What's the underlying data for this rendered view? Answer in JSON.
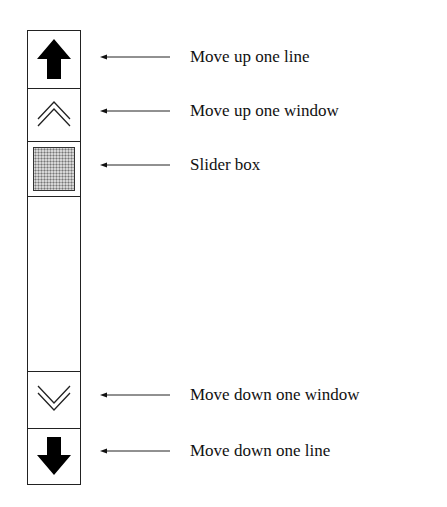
{
  "diagram": {
    "scrollbar": {
      "segments": [
        {
          "id": "line-up",
          "icon": "solid-up-arrow-icon"
        },
        {
          "id": "window-up",
          "icon": "double-chevron-up-icon"
        },
        {
          "id": "slider",
          "icon": "stippled-slider-box"
        },
        {
          "id": "track",
          "icon": ""
        },
        {
          "id": "window-down",
          "icon": "double-chevron-down-icon"
        },
        {
          "id": "line-down",
          "icon": "solid-down-arrow-icon"
        }
      ]
    },
    "callouts": [
      {
        "label": "Move up one line",
        "points_to": "line-up"
      },
      {
        "label": "Move up one window",
        "points_to": "window-up"
      },
      {
        "label": "Slider box",
        "points_to": "slider"
      },
      {
        "label": "Move down one window",
        "points_to": "window-down"
      },
      {
        "label": "Move down one line",
        "points_to": "line-down"
      }
    ],
    "colors": {
      "stroke": "#222222",
      "slider_fill": "#d6d6d6",
      "background": "#ffffff"
    }
  }
}
